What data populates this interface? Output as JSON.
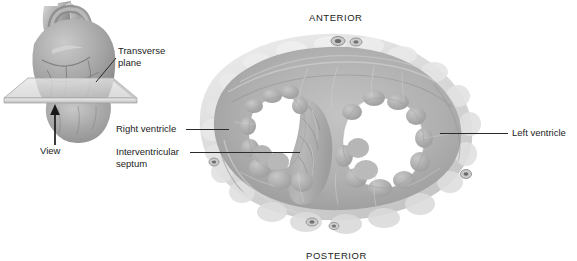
{
  "figure": {
    "title_orientation_top": "ANTERIOR",
    "title_orientation_bottom": "POSTERIOR"
  },
  "left_panel": {
    "name": "whole-heart-orientation-diagram",
    "labels": {
      "plane_line1": "Transverse",
      "plane_line2": "plane",
      "view_direction": "View"
    },
    "icon_names": [
      "heart-3d-illustration",
      "transverse-plane-slab",
      "view-direction-arrow-icon"
    ]
  },
  "right_panel": {
    "name": "heart-transverse-cross-section",
    "labels": {
      "right_ventricle": "Right ventricle",
      "interventricular_line1": "Interventricular",
      "interventricular_line2": "septum",
      "left_ventricle": "Left ventricle"
    }
  },
  "colors": {
    "myocardium_mid": "#b0b0b0",
    "myocardium_dark": "#8f8f8f",
    "myocardium_light": "#c9c9c9",
    "epicardial_fat": "#dcdcdc",
    "cavity": "#ffffff",
    "leader_line": "#2b2b2b",
    "text": "#1c1c1c"
  }
}
